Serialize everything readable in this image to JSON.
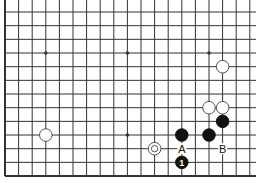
{
  "diagram": {
    "type": "go-board-fragment",
    "grid": {
      "x0": 5,
      "y0": 12,
      "dx": 13.6,
      "dy": 13.67,
      "cols": 19,
      "rows": 13,
      "left_edge": true,
      "bottom_edge": true,
      "top_edge": false,
      "right_edge": false
    },
    "colors": {
      "line": "#333333",
      "black": "#111111",
      "white": "#ffffff",
      "background": "#ffffff"
    },
    "hoshi": [
      [
        3,
        3
      ],
      [
        9,
        3
      ],
      [
        15,
        3
      ],
      [
        9,
        9
      ]
    ],
    "stones": [
      {
        "color": "white",
        "col": 16,
        "row": 4
      },
      {
        "color": "white",
        "col": 3,
        "row": 9
      },
      {
        "color": "white",
        "col": 15,
        "row": 7
      },
      {
        "color": "white",
        "col": 16,
        "row": 7
      },
      {
        "color": "black",
        "col": 16,
        "row": 8
      },
      {
        "color": "black",
        "col": 13,
        "row": 9
      },
      {
        "color": "black",
        "col": 15,
        "row": 9
      },
      {
        "color": "white",
        "col": 11,
        "row": 10,
        "marker": "circle"
      },
      {
        "color": "black",
        "col": 13,
        "row": 11,
        "label": "1"
      }
    ],
    "labels": [
      {
        "text": "A",
        "col": 13,
        "row": 10
      },
      {
        "text": "B",
        "col": 16,
        "row": 10
      }
    ]
  }
}
